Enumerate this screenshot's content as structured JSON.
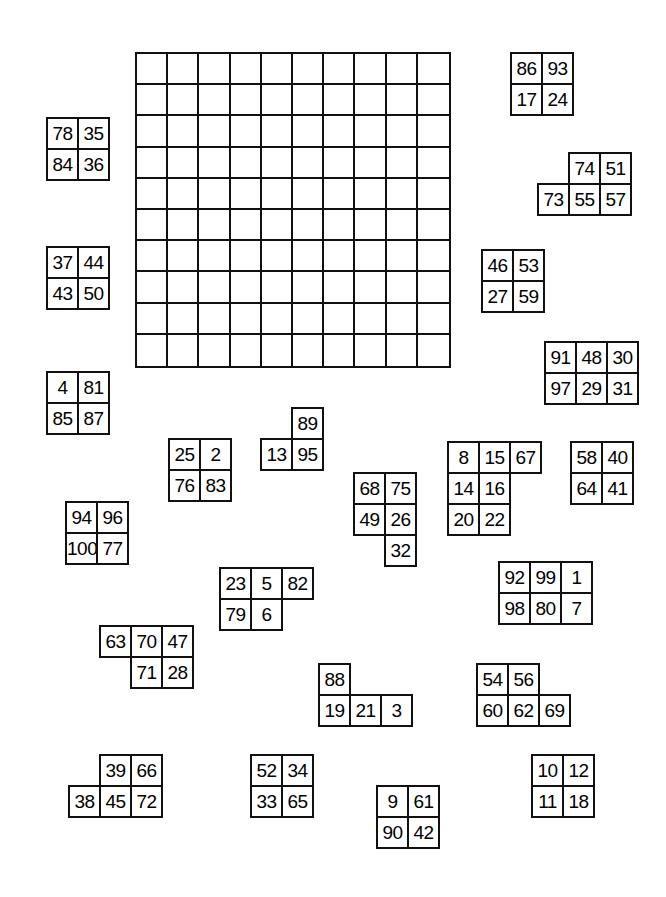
{
  "diagram": {
    "background_color": "#ffffff",
    "line_color": "#111111",
    "text_color": "#000000"
  },
  "board": {
    "name": "empty-10x10-grid",
    "rows": 10,
    "cols": 10,
    "x": 135,
    "y": 52,
    "cell_size": 31.2,
    "filled": false
  },
  "pieces": [
    {
      "id": "piece-86-93-17-24",
      "x": 510,
      "y": 52,
      "grid": [
        [
          "86",
          "93"
        ],
        [
          "17",
          "24"
        ]
      ]
    },
    {
      "id": "piece-78-35-84-36",
      "x": 46,
      "y": 117,
      "grid": [
        [
          "78",
          "35"
        ],
        [
          "84",
          "36"
        ]
      ]
    },
    {
      "id": "piece-74-51-73-55-57",
      "x": 537,
      "y": 152,
      "grid": [
        [
          "",
          "74",
          "51"
        ],
        [
          "73",
          "55",
          "57"
        ]
      ]
    },
    {
      "id": "piece-37-44-43-50",
      "x": 46,
      "y": 246,
      "grid": [
        [
          "37",
          "44"
        ],
        [
          "43",
          "50"
        ]
      ]
    },
    {
      "id": "piece-46-53-27-59",
      "x": 481,
      "y": 249,
      "grid": [
        [
          "46",
          "53"
        ],
        [
          "27",
          "59"
        ]
      ]
    },
    {
      "id": "piece-91-48-30-97-29-31",
      "x": 544,
      "y": 341,
      "grid": [
        [
          "91",
          "48",
          "30"
        ],
        [
          "97",
          "29",
          "31"
        ]
      ]
    },
    {
      "id": "piece-4-81-85-87",
      "x": 46,
      "y": 371,
      "grid": [
        [
          "4",
          "81"
        ],
        [
          "85",
          "87"
        ]
      ]
    },
    {
      "id": "piece-89-13-95",
      "x": 260,
      "y": 407,
      "grid": [
        [
          "",
          "89"
        ],
        [
          "13",
          "95"
        ]
      ]
    },
    {
      "id": "piece-25-2-76-83",
      "x": 168,
      "y": 438,
      "grid": [
        [
          "25",
          "2"
        ],
        [
          "76",
          "83"
        ]
      ]
    },
    {
      "id": "piece-8-15-67-14-16-20-22",
      "x": 447,
      "y": 441,
      "grid": [
        [
          "8",
          "15",
          "67"
        ],
        [
          "14",
          "16",
          ""
        ],
        [
          "20",
          "22",
          ""
        ]
      ]
    },
    {
      "id": "piece-58-40-64-41",
      "x": 570,
      "y": 441,
      "grid": [
        [
          "58",
          "40"
        ],
        [
          "64",
          "41"
        ]
      ]
    },
    {
      "id": "piece-68-75-49-26-32",
      "x": 353,
      "y": 472,
      "grid": [
        [
          "68",
          "75"
        ],
        [
          "49",
          "26"
        ],
        [
          "",
          "32"
        ]
      ]
    },
    {
      "id": "piece-94-96-100-77",
      "x": 65,
      "y": 501,
      "grid": [
        [
          "94",
          "96"
        ],
        [
          "100",
          "77"
        ]
      ]
    },
    {
      "id": "piece-23-5-82-79-6",
      "x": 219,
      "y": 567,
      "grid": [
        [
          "23",
          "5",
          "82"
        ],
        [
          "79",
          "6",
          ""
        ]
      ]
    },
    {
      "id": "piece-92-99-1-98-80-7",
      "x": 498,
      "y": 561,
      "grid": [
        [
          "92",
          "99",
          "1"
        ],
        [
          "98",
          "80",
          "7"
        ]
      ]
    },
    {
      "id": "piece-63-70-47-71-28",
      "x": 99,
      "y": 625,
      "grid": [
        [
          "63",
          "70",
          "47"
        ],
        [
          "",
          "71",
          "28"
        ]
      ]
    },
    {
      "id": "piece-88-19-21-3",
      "x": 318,
      "y": 663,
      "grid": [
        [
          "88",
          "",
          ""
        ],
        [
          "19",
          "21",
          "3"
        ]
      ]
    },
    {
      "id": "piece-54-56-60-62-69",
      "x": 476,
      "y": 663,
      "grid": [
        [
          "54",
          "56",
          ""
        ],
        [
          "60",
          "62",
          "69"
        ]
      ]
    },
    {
      "id": "piece-39-66-38-45-72",
      "x": 68,
      "y": 754,
      "grid": [
        [
          "",
          "39",
          "66"
        ],
        [
          "38",
          "45",
          "72"
        ]
      ]
    },
    {
      "id": "piece-52-34-33-65",
      "x": 250,
      "y": 754,
      "grid": [
        [
          "52",
          "34"
        ],
        [
          "33",
          "65"
        ]
      ]
    },
    {
      "id": "piece-10-12-11-18",
      "x": 531,
      "y": 754,
      "grid": [
        [
          "10",
          "12"
        ],
        [
          "11",
          "18"
        ]
      ]
    },
    {
      "id": "piece-9-61-90-42",
      "x": 376,
      "y": 785,
      "grid": [
        [
          "9",
          "61"
        ],
        [
          "90",
          "42"
        ]
      ]
    }
  ]
}
